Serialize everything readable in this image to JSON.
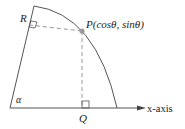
{
  "diagram": {
    "point_label": "P(cosθ, sinθ)",
    "R_label": "R",
    "Q_label": "Q",
    "angle_label": "α",
    "axis_label": "x-axis",
    "colors": {
      "line": "#555555",
      "dashed": "#999999",
      "point": "#9a9a9a"
    }
  }
}
